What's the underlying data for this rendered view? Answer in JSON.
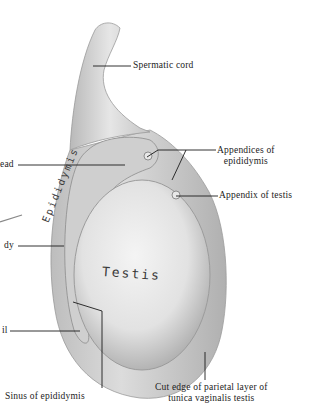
{
  "figure": {
    "style": "grayscale anatomical illustration",
    "colors": {
      "background": "#ffffff",
      "ink": "#1b1b1b",
      "tissue_light": "#e9e9e9",
      "tissue_mid": "#c8c8c8",
      "tissue_dark": "#8a8a8a"
    }
  },
  "labels": {
    "spermatic_cord": "Spermatic cord",
    "appendices_line1": "Appendices of",
    "appendices_line2": "epididymis",
    "appendix_testis": "Appendix of testis",
    "head": "ead",
    "body": "dy",
    "tail": "il",
    "sinus": "Sinus of epididymis",
    "cut_edge_line1": "Cut edge of parietal layer of",
    "cut_edge_line2": "tunica vaginalis testis"
  },
  "in_figure_text": {
    "epididymis": "Epididymis",
    "testis": "Testis"
  }
}
